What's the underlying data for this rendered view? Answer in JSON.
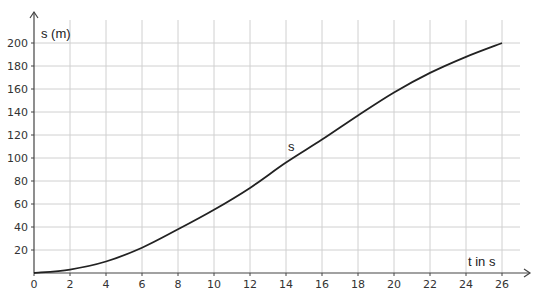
{
  "chart_data": {
    "type": "line",
    "title": "",
    "xlabel": "t in s",
    "ylabel": "s (m)",
    "xlim": [
      0,
      26
    ],
    "ylim": [
      0,
      200
    ],
    "grid": true,
    "legend": null,
    "x_ticks": [
      0,
      2,
      4,
      6,
      8,
      10,
      12,
      14,
      16,
      18,
      20,
      22,
      24,
      26
    ],
    "y_ticks": [
      20,
      40,
      60,
      80,
      100,
      120,
      140,
      160,
      180,
      200
    ],
    "series": [
      {
        "name": "s",
        "color": "#222222",
        "x": [
          0,
          2,
          4,
          6,
          8,
          10,
          12,
          14,
          16,
          18,
          20,
          22,
          24,
          26
        ],
        "y": [
          0,
          3,
          10,
          22,
          38,
          55,
          74,
          96,
          116,
          137,
          157,
          174,
          188,
          200
        ]
      }
    ],
    "annotations": [
      {
        "text": "s",
        "x": 14,
        "y": 108
      }
    ]
  },
  "labels": {
    "ylabel": "s (m)",
    "xlabel": "t in s",
    "curve": "s"
  },
  "colors": {
    "grid": "#d0d0d0",
    "axis": "#444444",
    "curve": "#222222"
  }
}
